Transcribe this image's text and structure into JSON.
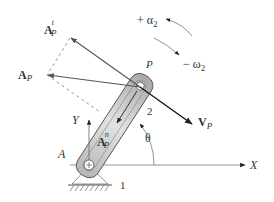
{
  "diagram": {
    "labels": {
      "alpha": "+ α",
      "alpha_sub": "2",
      "omega": "− ω",
      "omega_sub": "2",
      "point_p": "P",
      "link_number": "2",
      "velocity": "V",
      "velocity_sub": "P",
      "theta": "θ",
      "x_axis": "X",
      "y_axis": "Y",
      "pivot": "A",
      "ground_number": "1",
      "accel_total": "A",
      "accel_total_sub": "P",
      "accel_tangential": "A",
      "accel_tangential_sub": "P",
      "accel_tangential_sup": "t",
      "accel_normal": "A",
      "accel_normal_sub": "P",
      "accel_normal_sup": "n"
    },
    "colors": {
      "link_fill": "#c8c8c8",
      "link_stroke": "#555555",
      "vector": "#444444",
      "velocity_vector": "#111111",
      "dashed": "#999999",
      "axis": "#888888",
      "text": "#333333"
    }
  }
}
